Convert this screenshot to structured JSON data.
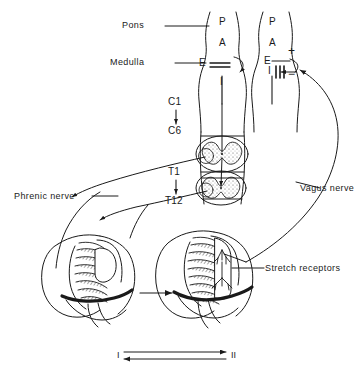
{
  "figure": {
    "stroke_color": "#1a1a1a",
    "background": "#ffffff"
  },
  "brainstem": {
    "regions": [
      {
        "name": "pons",
        "label": "Pons"
      },
      {
        "name": "medulla",
        "label": "Medulla"
      }
    ],
    "column_left": {
      "name": "state-I-brainstem",
      "labels": [
        "P",
        "A",
        "E",
        "I"
      ]
    },
    "column_right": {
      "name": "state-II-brainstem",
      "labels": [
        "P",
        "A",
        "E",
        "I"
      ],
      "signs": {
        "excitatory": "+",
        "inhibitory": "−"
      }
    }
  },
  "spinal": {
    "cervical": {
      "from": "C1",
      "to": "C6"
    },
    "thoracic": {
      "from": "T1",
      "to": "T12"
    }
  },
  "nerves": [
    {
      "name": "phrenic-nerve",
      "label": "Phrenic nerve"
    },
    {
      "name": "vagus-nerve",
      "label": "Vagus nerve"
    },
    {
      "name": "stretch-receptors",
      "label": "Stretch receptors"
    }
  ],
  "states": {
    "left": "I",
    "right": "II"
  }
}
